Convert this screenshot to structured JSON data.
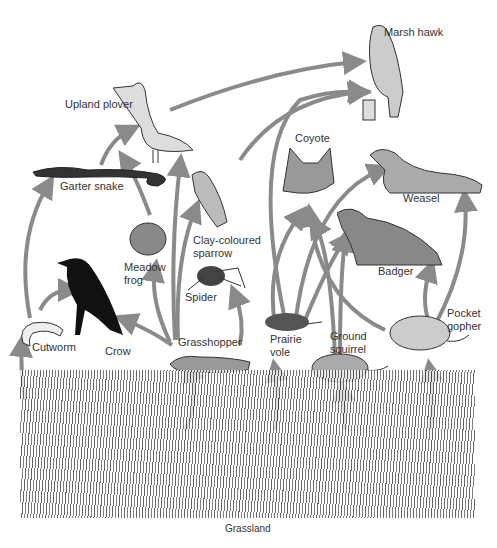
{
  "diagram": {
    "arrow_color": "#8a8a8a",
    "nodes": [
      {
        "id": "marsh_hawk",
        "label": "Marsh hawk"
      },
      {
        "id": "upland_plover",
        "label": "Upland plover"
      },
      {
        "id": "coyote",
        "label": "Coyote"
      },
      {
        "id": "weasel",
        "label": "Weasel"
      },
      {
        "id": "garter_snake",
        "label": "Garter snake"
      },
      {
        "id": "clay_sparrow",
        "label": "Clay-coloured sparrow"
      },
      {
        "id": "badger",
        "label": "Badger"
      },
      {
        "id": "meadow_frog",
        "label": "Meadow frog"
      },
      {
        "id": "spider",
        "label": "Spider"
      },
      {
        "id": "pocket_gopher",
        "label": "Pocket gopher"
      },
      {
        "id": "cutworm",
        "label": "Cutworm"
      },
      {
        "id": "crow",
        "label": "Crow"
      },
      {
        "id": "grasshopper",
        "label": "Grasshopper"
      },
      {
        "id": "prairie_vole",
        "label": "Prairie vole"
      },
      {
        "id": "ground_squirrel",
        "label": "Ground squirrel"
      },
      {
        "id": "grassland",
        "label": "Grassland"
      }
    ],
    "edges": [
      {
        "from": "garter_snake",
        "to": "upland_plover"
      },
      {
        "from": "upland_plover",
        "to": "marsh_hawk"
      },
      {
        "from": "clay_sparrow",
        "to": "marsh_hawk"
      },
      {
        "from": "prairie_vole",
        "to": "marsh_hawk"
      },
      {
        "from": "cutworm",
        "to": "garter_snake"
      },
      {
        "from": "cutworm",
        "to": "crow"
      },
      {
        "from": "meadow_frog",
        "to": "garter_snake"
      },
      {
        "from": "grasshopper",
        "to": "upland_plover"
      },
      {
        "from": "grasshopper",
        "to": "clay_sparrow"
      },
      {
        "from": "grasshopper",
        "to": "meadow_frog"
      },
      {
        "from": "grasshopper",
        "to": "crow"
      },
      {
        "from": "grasshopper",
        "to": "spider"
      },
      {
        "from": "prairie_vole",
        "to": "coyote"
      },
      {
        "from": "prairie_vole",
        "to": "weasel"
      },
      {
        "from": "prairie_vole",
        "to": "badger"
      },
      {
        "from": "ground_squirrel",
        "to": "coyote"
      },
      {
        "from": "ground_squirrel",
        "to": "badger"
      },
      {
        "from": "pocket_gopher",
        "to": "coyote"
      },
      {
        "from": "pocket_gopher",
        "to": "badger"
      },
      {
        "from": "pocket_gopher",
        "to": "weasel"
      },
      {
        "from": "grassland",
        "to": "cutworm"
      },
      {
        "from": "grassland",
        "to": "grasshopper"
      },
      {
        "from": "grassland",
        "to": "prairie_vole"
      },
      {
        "from": "grassland",
        "to": "ground_squirrel"
      },
      {
        "from": "grassland",
        "to": "pocket_gopher"
      }
    ]
  },
  "labels": {
    "marsh_hawk": "Marsh hawk",
    "upland_plover": "Upland plover",
    "coyote": "Coyote",
    "weasel": "Weasel",
    "garter_snake": "Garter snake",
    "clay_sparrow_1": "Clay-coloured",
    "clay_sparrow_2": "sparrow",
    "badger": "Badger",
    "meadow_frog_1": "Meadow",
    "meadow_frog_2": "frog",
    "spider": "Spider",
    "pocket_gopher_1": "Pocket",
    "pocket_gopher_2": "gopher",
    "cutworm": "Cutworm",
    "crow": "Crow",
    "grasshopper": "Grasshopper",
    "prairie_vole_1": "Prairie",
    "prairie_vole_2": "vole",
    "ground_squirrel_1": "Ground",
    "ground_squirrel_2": "squirrel",
    "grassland": "Grassland"
  }
}
